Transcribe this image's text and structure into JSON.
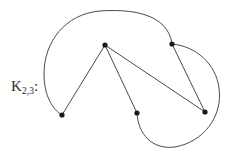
{
  "figure": {
    "label_base": "K",
    "label_subscript": "2,3",
    "label_colon": ":",
    "label_full": "K2,3:",
    "background_color": "#ffffff",
    "stroke_color": "#4a4a4a",
    "vertex_color": "#1a1a1a",
    "stroke_width": 1,
    "vertex_radius": 2.6,
    "width": 238,
    "height": 155
  },
  "chart_data": {
    "type": "diagram",
    "title": "K2,3:",
    "vertices": [
      {
        "id": "u1",
        "label": "top-apex",
        "x": 105,
        "y": 45,
        "part": "A"
      },
      {
        "id": "u2",
        "label": "upper-right-apex",
        "x": 172,
        "y": 44,
        "part": "A"
      },
      {
        "id": "v1",
        "label": "bottom-left",
        "x": 62,
        "y": 115,
        "part": "B"
      },
      {
        "id": "v2",
        "label": "bottom-middle",
        "x": 137,
        "y": 113,
        "part": "B"
      },
      {
        "id": "v3",
        "label": "bottom-right",
        "x": 205,
        "y": 112,
        "part": "B"
      }
    ],
    "edges": [
      {
        "id": "e1",
        "from": "u1",
        "to": "v1",
        "shape": "straight"
      },
      {
        "id": "e2",
        "from": "u1",
        "to": "v2",
        "shape": "straight"
      },
      {
        "id": "e3",
        "from": "u1",
        "to": "v3",
        "shape": "straight"
      },
      {
        "id": "e4",
        "from": "u2",
        "to": "v3",
        "shape": "straight"
      },
      {
        "id": "e5",
        "from": "u2",
        "to": "v1",
        "shape": "arc-over-top"
      },
      {
        "id": "e6",
        "from": "u2",
        "to": "v2",
        "shape": "arc-around-right"
      }
    ],
    "edge_paths": {
      "e5": "M 172 44 C 168 12 128 9 100 11 C 65 14 44 42 44 74 C 44 96 53 110 62 115",
      "e6": "M 172 44 C 196 46 216 64 219 88 C 223 117 203 142 175 147 C 152 150 138 134 137 113"
    },
    "xlim": [
      0,
      238
    ],
    "ylim": [
      0,
      155
    ],
    "grid": false,
    "legend": "none"
  }
}
